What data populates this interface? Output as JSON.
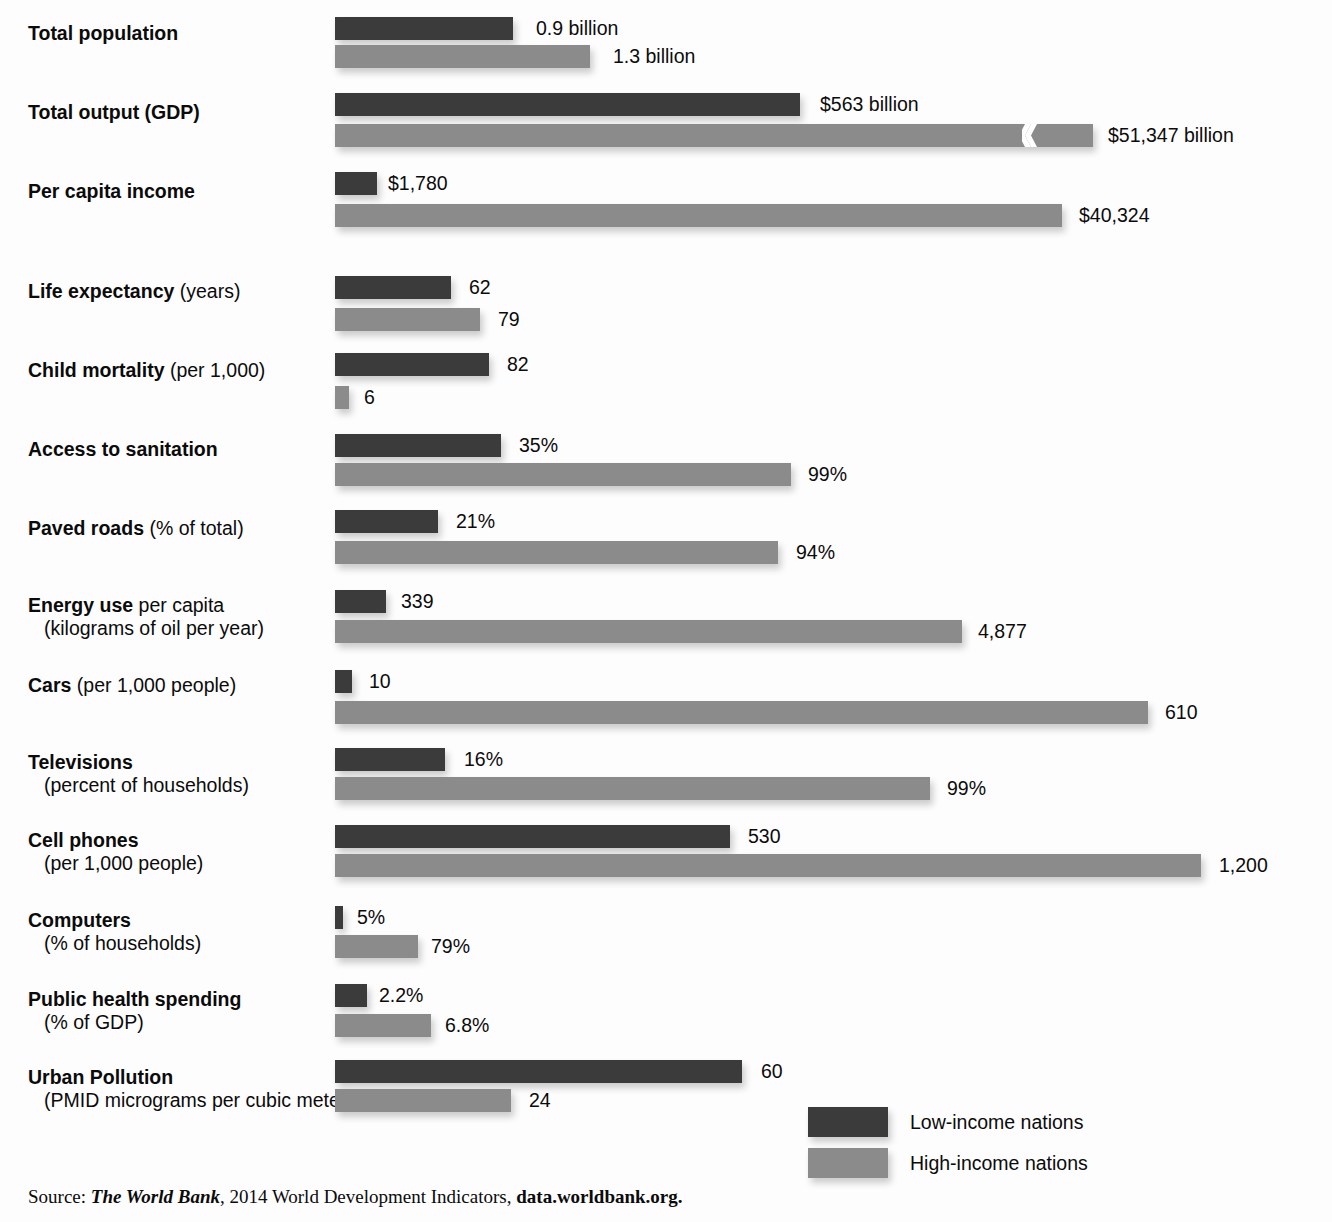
{
  "legend": {
    "low_label": "Low-income nations",
    "high_label": "High-income nations",
    "low_color": "#3b3b3b",
    "high_color": "#8b8b8b"
  },
  "source": {
    "prefix": "Source: ",
    "publication": "The World Bank",
    "middle": ", 2014 World Development Indicators, ",
    "url": "data.worldbank.org."
  },
  "chart_data": {
    "type": "bar",
    "orientation": "horizontal",
    "title": "",
    "xlabel": "",
    "ylabel": "",
    "grid": false,
    "legend_position": "bottom-right",
    "series": [
      {
        "name": "Low-income nations",
        "color": "#3b3b3b"
      },
      {
        "name": "High-income nations",
        "color": "#8b8b8b"
      }
    ],
    "note": "Each indicator uses its own scale; the GDP high-income bar is drawn with an axis break.",
    "categories": [
      "Total population",
      "Total output (GDP)",
      "Per capita income",
      "Life expectancy (years)",
      "Child mortality (per 1,000)",
      "Access to sanitation",
      "Paved roads (% of total)",
      "Energy use per capita (kilograms of oil per year)",
      "Cars (per 1,000 people)",
      "Televisions (percent of households)",
      "Cell phones (per 1,000 people)",
      "Computers (% of households)",
      "Public health spending (% of GDP)",
      "Urban Pollution (PMID micrograms per cubic meter)"
    ],
    "rows": [
      {
        "label_bold": "Total population",
        "label_rest": "",
        "label_sub": "",
        "low_value": "0.9 billion",
        "high_value": "1.3 billion",
        "low_number": 0.9,
        "high_number": 1.3,
        "unit": "billion"
      },
      {
        "label_bold": "Total output (GDP)",
        "label_rest": "",
        "label_sub": "",
        "low_value": "$563 billion",
        "high_value": "$51,347 billion",
        "low_number": 563,
        "high_number": 51347,
        "unit": "billion US$",
        "axis_break": true
      },
      {
        "label_bold": "Per capita income",
        "label_rest": "",
        "label_sub": "",
        "low_value": "$1,780",
        "high_value": "$40,324",
        "low_number": 1780,
        "high_number": 40324,
        "unit": "US$"
      },
      {
        "label_bold": "Life expectancy",
        "label_rest": " (years)",
        "label_sub": "",
        "low_value": "62",
        "high_value": "79",
        "low_number": 62,
        "high_number": 79,
        "unit": "years"
      },
      {
        "label_bold": "Child mortality",
        "label_rest": " (per 1,000)",
        "label_sub": "",
        "low_value": "82",
        "high_value": "6",
        "low_number": 82,
        "high_number": 6,
        "unit": "per 1,000"
      },
      {
        "label_bold": "Access to sanitation",
        "label_rest": "",
        "label_sub": "",
        "low_value": "35%",
        "high_value": "99%",
        "low_number": 35,
        "high_number": 99,
        "unit": "percent"
      },
      {
        "label_bold": "Paved roads",
        "label_rest": " (% of total)",
        "label_sub": "",
        "low_value": "21%",
        "high_value": "94%",
        "low_number": 21,
        "high_number": 94,
        "unit": "percent"
      },
      {
        "label_bold": "Energy use",
        "label_rest": " per capita",
        "label_sub": "(kilograms of oil per year)",
        "low_value": "339",
        "high_value": "4,877",
        "low_number": 339,
        "high_number": 4877,
        "unit": "kg of oil per year"
      },
      {
        "label_bold": "Cars",
        "label_rest": " (per 1,000 people)",
        "label_sub": "",
        "low_value": "10",
        "high_value": "610",
        "low_number": 10,
        "high_number": 610,
        "unit": "per 1,000 people"
      },
      {
        "label_bold": "Televisions",
        "label_rest": "",
        "label_sub": "(percent of households)",
        "low_value": "16%",
        "high_value": "99%",
        "low_number": 16,
        "high_number": 99,
        "unit": "percent of households"
      },
      {
        "label_bold": "Cell phones",
        "label_rest": "",
        "label_sub": "(per 1,000 people)",
        "low_value": "530",
        "high_value": "1,200",
        "low_number": 530,
        "high_number": 1200,
        "unit": "per 1,000 people"
      },
      {
        "label_bold": "Computers",
        "label_rest": "",
        "label_sub": "(% of households)",
        "low_value": "5%",
        "high_value": "79%",
        "low_number": 5,
        "high_number": 79,
        "unit": "percent of households"
      },
      {
        "label_bold": "Public health spending",
        "label_rest": "",
        "label_sub": "(% of GDP)",
        "low_value": "2.2%",
        "high_value": "6.8%",
        "low_number": 2.2,
        "high_number": 6.8,
        "unit": "percent of GDP"
      },
      {
        "label_bold": "Urban Pollution",
        "label_rest": "",
        "label_sub": "(PMID micrograms per cubic meter)",
        "low_value": "60",
        "high_value": "24",
        "low_number": 60,
        "high_number": 24,
        "unit": "micrograms per cubic meter"
      }
    ]
  },
  "layout": {
    "bar_start_x": 335,
    "rows": [
      {
        "label_x": 28,
        "label_y": 22,
        "label_align": "left",
        "low": {
          "y": 17,
          "w": 178,
          "vx": 536,
          "vy": 17
        },
        "high": {
          "y": 45,
          "w": 255,
          "vx": 613,
          "vy": 45
        }
      },
      {
        "label_x": 28,
        "label_y": 101,
        "label_align": "left",
        "low": {
          "y": 93,
          "w": 465,
          "vx": 820,
          "vy": 93
        },
        "high": {
          "y": 124,
          "w": 758,
          "vx": 1108,
          "vy": 124,
          "break_x": 1022
        }
      },
      {
        "label_x": 28,
        "label_y": 180,
        "label_align": "left",
        "low": {
          "y": 172,
          "w": 42,
          "vx": 388,
          "vy": 172
        },
        "high": {
          "y": 204,
          "w": 727,
          "vx": 1079,
          "vy": 204
        }
      },
      {
        "label_x": 28,
        "label_y": 280,
        "label_align": "left",
        "low": {
          "y": 276,
          "w": 116,
          "vx": 469,
          "vy": 276
        },
        "high": {
          "y": 308,
          "w": 145,
          "vx": 498,
          "vy": 308
        }
      },
      {
        "label_x": 28,
        "label_y": 359,
        "label_align": "left",
        "low": {
          "y": 353,
          "w": 154,
          "vx": 507,
          "vy": 353
        },
        "high": {
          "y": 386,
          "w": 14,
          "vx": 364,
          "vy": 386
        }
      },
      {
        "label_x": 28,
        "label_y": 438,
        "label_align": "left",
        "low": {
          "y": 434,
          "w": 166,
          "vx": 519,
          "vy": 434
        },
        "high": {
          "y": 463,
          "w": 456,
          "vx": 808,
          "vy": 463
        }
      },
      {
        "label_x": 28,
        "label_y": 517,
        "label_align": "left",
        "low": {
          "y": 510,
          "w": 103,
          "vx": 456,
          "vy": 510
        },
        "high": {
          "y": 541,
          "w": 443,
          "vx": 796,
          "vy": 541
        }
      },
      {
        "label_x": 28,
        "label_y": 594,
        "label_align": "left",
        "low": {
          "y": 590,
          "w": 51,
          "vx": 401,
          "vy": 590
        },
        "high": {
          "y": 620,
          "w": 627,
          "vx": 978,
          "vy": 620
        }
      },
      {
        "label_x": 28,
        "label_y": 674,
        "label_align": "left",
        "low": {
          "y": 670,
          "w": 17,
          "vx": 369,
          "vy": 670
        },
        "high": {
          "y": 701,
          "w": 813,
          "vx": 1165,
          "vy": 701
        }
      },
      {
        "label_x": 28,
        "label_y": 751,
        "label_align": "left",
        "low": {
          "y": 748,
          "w": 110,
          "vx": 464,
          "vy": 748
        },
        "high": {
          "y": 777,
          "w": 595,
          "vx": 947,
          "vy": 777
        }
      },
      {
        "label_x": 28,
        "label_y": 829,
        "label_align": "left",
        "low": {
          "y": 825,
          "w": 395,
          "vx": 748,
          "vy": 825
        },
        "high": {
          "y": 854,
          "w": 866,
          "vx": 1219,
          "vy": 854
        }
      },
      {
        "label_x": 28,
        "label_y": 909,
        "label_align": "left",
        "low": {
          "y": 906,
          "w": 8,
          "vx": 357,
          "vy": 906
        },
        "high": {
          "y": 935,
          "w": 83,
          "vx": 431,
          "vy": 935
        }
      },
      {
        "label_x": 28,
        "label_y": 988,
        "label_align": "left",
        "low": {
          "y": 984,
          "w": 32,
          "vx": 379,
          "vy": 984
        },
        "high": {
          "y": 1014,
          "w": 96,
          "vx": 445,
          "vy": 1014
        }
      },
      {
        "label_x": 28,
        "label_y": 1066,
        "label_align": "left",
        "low": {
          "y": 1060,
          "w": 407,
          "vx": 761,
          "vy": 1060
        },
        "high": {
          "y": 1089,
          "w": 176,
          "vx": 529,
          "vy": 1089
        }
      }
    ],
    "legend": {
      "swatch_x": 808,
      "low_y": 1107,
      "high_y": 1148,
      "text_x": 910
    }
  }
}
